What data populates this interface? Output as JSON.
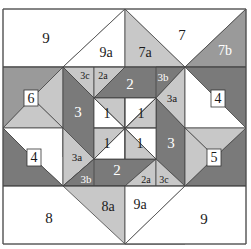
{
  "diagram": {
    "type": "quilt-block-piecing-diagram",
    "colors": {
      "white": "#ffffff",
      "light_gray": "#c8c8c8",
      "medium_gray": "#9a9a9a",
      "dark_gray": "#7a7a7a",
      "outline": "#444444"
    },
    "labels": {
      "top_left_9": "9",
      "top_left_9a": "9a",
      "top_7a": "7a",
      "top_7": "7",
      "top_7b": "7b",
      "tl_3c": "3c",
      "tl_2a": "2a",
      "top_2": "2",
      "tr_3b": "3b",
      "tr_3a": "3a",
      "left_6": "6",
      "left_3": "3",
      "right_4": "4",
      "center_1_tl": "1",
      "center_1_tr": "1",
      "center_1_bl": "1",
      "center_1_br": "1",
      "right_3": "3",
      "left_4": "4",
      "bl_3a": "3a",
      "right_5": "5",
      "bl_3b": "3b",
      "bottom_2": "2",
      "br_2a": "2a",
      "br_3c": "3c",
      "bottom_8": "8",
      "bottom_8a": "8a",
      "bottom_9a": "9a",
      "bottom_right_9": "9"
    }
  }
}
